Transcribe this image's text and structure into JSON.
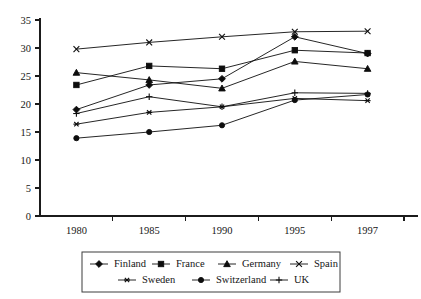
{
  "chart_data": {
    "type": "line",
    "title": "",
    "xlabel": "",
    "ylabel": "",
    "categories": [
      "1980",
      "1985",
      "1990",
      "1995",
      "1997"
    ],
    "ylim": [
      0,
      35
    ],
    "yticks": [
      0,
      5,
      10,
      15,
      20,
      25,
      30,
      35
    ],
    "ytick_labels": [
      "0",
      "5",
      "10",
      "15",
      "20",
      "25",
      "30",
      "35"
    ],
    "grid": false,
    "legend_position": "bottom",
    "series": [
      {
        "name": "Finland",
        "marker": "diamond",
        "marker_glyph": "filled-diamond-marker",
        "values": [
          19.0,
          23.4,
          24.5,
          32.0,
          29.0
        ]
      },
      {
        "name": "France",
        "marker": "square",
        "marker_glyph": "filled-square-marker",
        "values": [
          23.4,
          26.8,
          26.3,
          29.6,
          29.1
        ]
      },
      {
        "name": "Germany",
        "marker": "triangle",
        "marker_glyph": "filled-triangle-marker",
        "values": [
          25.6,
          24.3,
          22.8,
          27.6,
          26.3
        ]
      },
      {
        "name": "Spain",
        "marker": "x",
        "marker_glyph": "cross-x-marker",
        "values": [
          29.8,
          31.0,
          32.0,
          32.9,
          33.0
        ]
      },
      {
        "name": "Sweden",
        "marker": "asterisk",
        "marker_glyph": "asterisk-marker",
        "values": [
          16.4,
          18.5,
          19.5,
          21.0,
          20.6
        ]
      },
      {
        "name": "Switzerland",
        "marker": "circle",
        "marker_glyph": "filled-circle-marker",
        "values": [
          13.9,
          15.0,
          16.2,
          20.7,
          21.7
        ]
      },
      {
        "name": "UK",
        "marker": "plus",
        "marker_glyph": "plus-marker",
        "values": [
          18.3,
          21.3,
          19.5,
          22.0,
          21.9
        ]
      }
    ]
  },
  "legend": {
    "rows": [
      [
        "Finland",
        "France",
        "Germany",
        "Spain"
      ],
      [
        "Sweden",
        "Switzerland",
        "UK"
      ]
    ]
  },
  "colors": {
    "ink": "#0d0d0d",
    "axis": "#1b1b1b",
    "legend_border": "#3c3c3c",
    "background": "#ffffff"
  }
}
